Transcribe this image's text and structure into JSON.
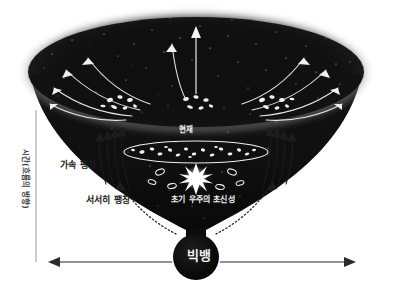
{
  "figure": {
    "type": "cosmology-expansion-diagram",
    "title_visible": false,
    "background_color": "#ffffff",
    "ink_color": "#1c1c1c",
    "highlight_color": "#f2f2f2"
  },
  "axis": {
    "vertical_label": "시간(흐름의 방향)",
    "vertical_line": {
      "x": 36,
      "y_top": 110,
      "y_bottom": 262,
      "color": "#9a9a9a"
    },
    "horizontal_arrow": {
      "y": 262,
      "x_left": 52,
      "x_right": 352,
      "double_headed": true,
      "color": "#2b2b2b"
    }
  },
  "labels": {
    "accelerating_expansion": "가속 팽창",
    "slow_expansion": "서서히 팽창",
    "present": "현재",
    "early_universe_supernova": "초기 우주의 초신성",
    "big_bang": "빅뱅"
  },
  "regions": {
    "cone_top_ellipse": {
      "cx": 196,
      "cy": 72,
      "rx": 178,
      "ry": 62,
      "fill": "#151515"
    },
    "present_ellipse": {
      "cx": 196,
      "cy": 152,
      "rx": 72,
      "ry": 11,
      "stroke": "#efefef"
    },
    "big_bang_circle": {
      "cx": 196,
      "cy": 257,
      "r": 23,
      "fill": "#0c0c0c"
    },
    "funnel_neck": {
      "cx": 196,
      "cy": 232,
      "width": 14
    }
  },
  "galaxy_clusters": [
    {
      "cx": 120,
      "cy": 104,
      "count": 7
    },
    {
      "cx": 196,
      "cy": 104,
      "count": 6
    },
    {
      "cx": 272,
      "cy": 104,
      "count": 7
    }
  ],
  "present_galaxies_count": 18,
  "early_galaxies_count": 6,
  "supernova": {
    "cx": 196,
    "cy": 178,
    "points": 10,
    "radius": 13
  },
  "arrows": {
    "top_outward_curved_count": 10,
    "top_center_vertical": {
      "x": 196,
      "y_from": 92,
      "y_to": 30
    },
    "flank_accelerating_left_count": 4,
    "flank_accelerating_right_count": 4,
    "wall_slow_dotted_count": 2
  },
  "stars": {
    "approx_count": 260,
    "color": "#ffffff"
  }
}
